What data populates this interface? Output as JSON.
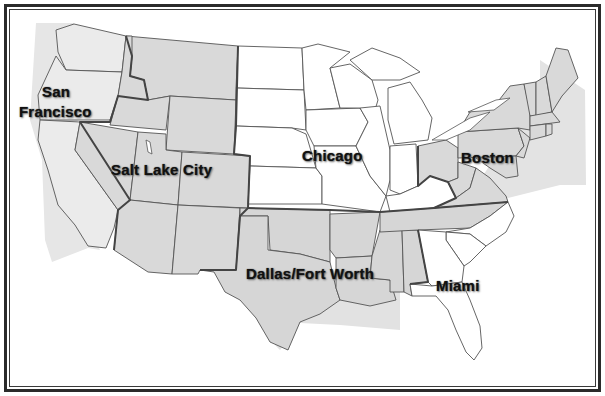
{
  "map": {
    "title": "",
    "colors": {
      "frame": "#2b2b2b",
      "region_shaded": "#d9d9d9",
      "region_light": "#e9e9e9",
      "offshore": "#e6e6e6",
      "region_white": "#ffffff",
      "state_border": "#555555",
      "region_border": "#444444"
    },
    "regions": [
      {
        "name": "San Francisco",
        "label_line1": "San",
        "label_line2": "Francisco",
        "shading": "light-gray",
        "states": [
          "WA",
          "OR",
          "CA"
        ]
      },
      {
        "name": "Salt Lake City",
        "label": "Salt Lake City",
        "shading": "gray",
        "states": [
          "MT",
          "ID",
          "WY",
          "NV",
          "UT",
          "CO",
          "AZ",
          "NM"
        ]
      },
      {
        "name": "Chicago",
        "label": "Chicago",
        "shading": "white",
        "states": [
          "ND",
          "SD",
          "NE",
          "KS",
          "MN",
          "IA",
          "MO",
          "WI",
          "IL",
          "MI",
          "IN",
          "KY"
        ]
      },
      {
        "name": "Boston",
        "label": "Boston",
        "shading": "gray",
        "states": [
          "OH",
          "WV",
          "VA",
          "PA",
          "NY",
          "NJ",
          "DE",
          "MD",
          "CT",
          "RI",
          "MA",
          "VT",
          "NH",
          "ME"
        ]
      },
      {
        "name": "Dallas/Fort Worth",
        "label": "Dallas/Fort Worth",
        "shading": "gray",
        "states": [
          "TX",
          "OK",
          "AR",
          "LA",
          "MS",
          "AL",
          "TN"
        ]
      },
      {
        "name": "Miami",
        "label": "Miami",
        "shading": "white",
        "states": [
          "NC",
          "SC",
          "GA",
          "FL"
        ]
      }
    ]
  }
}
